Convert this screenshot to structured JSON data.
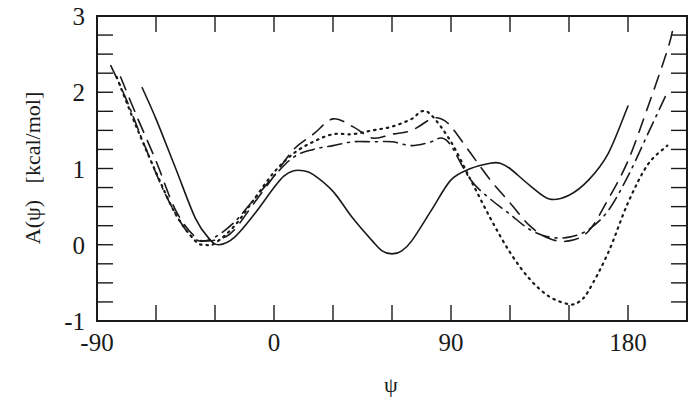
{
  "chart_data": {
    "type": "line",
    "title": "",
    "xlabel": "ψ",
    "ylabel": "A(ψ)   [kcal/mol]",
    "xlim": [
      -90,
      210
    ],
    "ylim": [
      -1,
      3
    ],
    "xticks": [
      -90,
      0,
      90,
      180
    ],
    "xtick_labels": [
      "-90",
      "0",
      "90",
      "180"
    ],
    "x_minor_step": 30,
    "yticks": [
      -1,
      0,
      1,
      2,
      3
    ],
    "ytick_labels": [
      "-1",
      "0",
      "1",
      "2",
      "3"
    ],
    "y_minor_step": 0.25,
    "grid": false,
    "legend": "none",
    "series": [
      {
        "name": "solid",
        "style": "solid",
        "x": [
          -67,
          -60,
          -50,
          -40,
          -33,
          -28,
          -20,
          -10,
          0,
          5,
          10,
          15,
          20,
          30,
          40,
          50,
          55,
          60,
          65,
          70,
          80,
          90,
          100,
          110,
          115,
          120,
          130,
          140,
          150,
          160,
          170,
          180
        ],
        "y": [
          2.06,
          1.65,
          1.0,
          0.35,
          0.08,
          0.0,
          0.1,
          0.4,
          0.75,
          0.9,
          0.97,
          0.97,
          0.92,
          0.7,
          0.35,
          0.05,
          -0.08,
          -0.12,
          -0.08,
          0.05,
          0.45,
          0.85,
          1.0,
          1.07,
          1.07,
          1.0,
          0.78,
          0.6,
          0.65,
          0.85,
          1.2,
          1.82
        ]
      },
      {
        "name": "dotted",
        "style": "dotted",
        "x": [
          -80,
          -70,
          -60,
          -50,
          -40,
          -35,
          -30,
          -20,
          -10,
          0,
          10,
          20,
          30,
          40,
          50,
          60,
          70,
          75,
          80,
          90,
          100,
          110,
          120,
          130,
          140,
          150,
          155,
          160,
          170,
          180,
          190,
          200
        ],
        "y": [
          2.2,
          1.55,
          0.95,
          0.4,
          0.05,
          0.0,
          0.02,
          0.25,
          0.6,
          0.95,
          1.2,
          1.35,
          1.45,
          1.45,
          1.5,
          1.55,
          1.65,
          1.75,
          1.7,
          1.35,
          0.85,
          0.35,
          -0.1,
          -0.45,
          -0.68,
          -0.78,
          -0.75,
          -0.6,
          -0.1,
          0.55,
          1.05,
          1.3
        ]
      },
      {
        "name": "long-dash",
        "style": "dashed",
        "x": [
          -78,
          -70,
          -60,
          -50,
          -40,
          -33,
          -25,
          -20,
          -10,
          0,
          10,
          20,
          30,
          40,
          50,
          60,
          70,
          80,
          85,
          90,
          100,
          110,
          120,
          130,
          140,
          150,
          160,
          170,
          180,
          190,
          200,
          203
        ],
        "y": [
          2.2,
          1.7,
          1.1,
          0.45,
          0.1,
          0.05,
          0.1,
          0.2,
          0.55,
          0.9,
          1.25,
          1.45,
          1.65,
          1.55,
          1.4,
          1.45,
          1.5,
          1.65,
          1.65,
          1.55,
          1.2,
          0.85,
          0.55,
          0.25,
          0.08,
          0.05,
          0.18,
          0.6,
          1.1,
          1.8,
          2.55,
          2.85
        ]
      },
      {
        "name": "dash-dot",
        "style": "dashdot",
        "x": [
          -83,
          -75,
          -65,
          -55,
          -45,
          -38,
          -30,
          -20,
          -10,
          0,
          10,
          20,
          30,
          40,
          50,
          60,
          70,
          80,
          85,
          90,
          100,
          110,
          120,
          130,
          140,
          150,
          160,
          170,
          180,
          190,
          200
        ],
        "y": [
          2.35,
          1.9,
          1.25,
          0.65,
          0.2,
          0.05,
          0.1,
          0.3,
          0.6,
          0.9,
          1.15,
          1.25,
          1.3,
          1.35,
          1.35,
          1.35,
          1.3,
          1.35,
          1.4,
          1.3,
          0.85,
          0.6,
          0.4,
          0.2,
          0.1,
          0.1,
          0.2,
          0.45,
          0.9,
          1.45,
          2.0
        ]
      }
    ]
  }
}
